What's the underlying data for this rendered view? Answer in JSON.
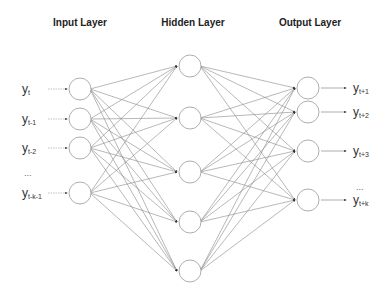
{
  "diagram": {
    "type": "neural-network",
    "titles": {
      "input": "Input Layer",
      "hidden": "Hidden Layer",
      "output": "Output Layer"
    },
    "colors": {
      "edge": "#888888",
      "node_stroke": "#999999",
      "text": "#333333"
    },
    "input_nodes": [
      {
        "label": "y",
        "sub": "t",
        "cx": 80,
        "cy": 89
      },
      {
        "label": "y",
        "sub": "t-1",
        "cx": 80,
        "cy": 119
      },
      {
        "label": "y",
        "sub": "t-2",
        "cx": 80,
        "cy": 148
      },
      {
        "label": "y",
        "sub": "t-k-1",
        "cx": 80,
        "cy": 193
      }
    ],
    "input_ellipsis": "...",
    "hidden_nodes": [
      {
        "cx": 190,
        "cy": 66
      },
      {
        "cx": 190,
        "cy": 118
      },
      {
        "cx": 190,
        "cy": 172
      },
      {
        "cx": 190,
        "cy": 222
      },
      {
        "cx": 190,
        "cy": 271
      }
    ],
    "output_nodes": [
      {
        "label": "y",
        "sub": "t+1",
        "cx": 308,
        "cy": 88
      },
      {
        "label": "y",
        "sub": "t+2",
        "cx": 308,
        "cy": 112
      },
      {
        "label": "y",
        "sub": "t+3",
        "cx": 308,
        "cy": 151
      },
      {
        "label": "y",
        "sub": "t+k",
        "cx": 308,
        "cy": 200
      }
    ],
    "output_ellipsis": "..."
  }
}
